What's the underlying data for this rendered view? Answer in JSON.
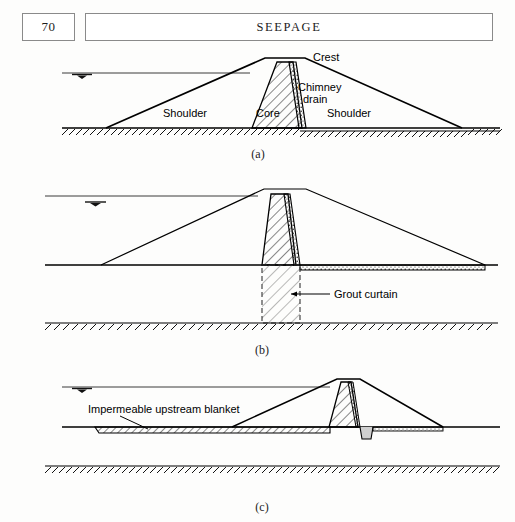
{
  "header": {
    "page_number": "70",
    "running_head": "SEEPAGE",
    "box_border_color": "#8a8a8a"
  },
  "colors": {
    "ink": "#000000",
    "paper": "#fdfdfc",
    "thin_line": "#3a3a3a",
    "hatch": "#1a1a1a",
    "light_hatch": "#555555"
  },
  "figures": [
    {
      "id": "a",
      "caption": "(a)",
      "labels": {
        "crest": "Crest",
        "chimney_drain_line1": "Chimney",
        "chimney_drain_line2": "drain",
        "core": "Core",
        "shoulder_upstream": "Shoulder",
        "shoulder_downstream": "Shoulder"
      },
      "parts": [
        "water-surface-line",
        "water-table-symbol",
        "ground-line",
        "ground-hatching",
        "embankment-outline",
        "core-trapezoid-hatched",
        "chimney-drain-strip"
      ]
    },
    {
      "id": "b",
      "caption": "(b)",
      "labels": {
        "grout_curtain": "Grout curtain"
      },
      "parts": [
        "water-surface-line",
        "water-table-symbol",
        "ground-line",
        "embankment-outline",
        "core-trapezoid-hatched",
        "chimney-drain-strip",
        "blanket-drain-strip",
        "grout-curtain-dashed-box",
        "grout-curtain-leader",
        "bedrock-line",
        "bedrock-hatching"
      ]
    },
    {
      "id": "c",
      "caption": "(c)",
      "labels": {
        "upstream_blanket": "Impermeable upstream blanket"
      },
      "parts": [
        "water-surface-line",
        "water-table-symbol",
        "ground-line",
        "embankment-outline",
        "core-trapezoid-hatched",
        "chimney-drain-strip",
        "upstream-blanket-hatched-strip",
        "upstream-blanket-leader",
        "toe-drain-trench",
        "downstream-drain-strip",
        "bedrock-line",
        "bedrock-hatching"
      ]
    }
  ]
}
